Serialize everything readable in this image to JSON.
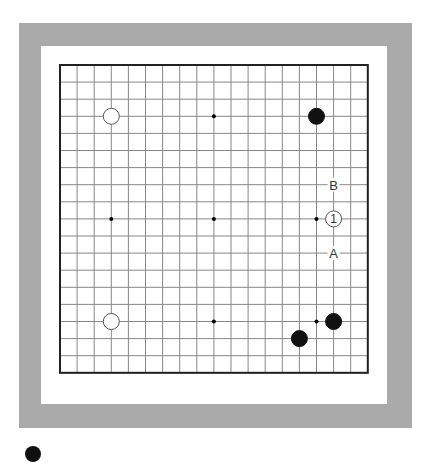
{
  "board": {
    "size": 19,
    "origin_x": 60,
    "origin_y": 65,
    "spacing": 17.1,
    "colors": {
      "frame": "#aaaaaa",
      "grid_line": "#888888",
      "border_line": "#222222",
      "black_stone": "#111111",
      "white_stone_fill": "#ffffff",
      "white_stone_edge": "#555555",
      "label": "#333333"
    },
    "star_points": [
      [
        3,
        3
      ],
      [
        9,
        3
      ],
      [
        15,
        3
      ],
      [
        3,
        9
      ],
      [
        9,
        9
      ],
      [
        15,
        9
      ],
      [
        3,
        15
      ],
      [
        9,
        15
      ],
      [
        15,
        15
      ]
    ],
    "stones": [
      {
        "color": "white",
        "col": 3,
        "row": 3
      },
      {
        "color": "black",
        "col": 15,
        "row": 3
      },
      {
        "color": "white",
        "col": 16,
        "row": 9,
        "label": "1"
      },
      {
        "color": "white",
        "col": 3,
        "row": 15
      },
      {
        "color": "black",
        "col": 16,
        "row": 15
      },
      {
        "color": "black",
        "col": 14,
        "row": 16
      }
    ],
    "labels": [
      {
        "text": "B",
        "col": 16,
        "row": 7
      },
      {
        "text": "A",
        "col": 16,
        "row": 11
      }
    ]
  }
}
